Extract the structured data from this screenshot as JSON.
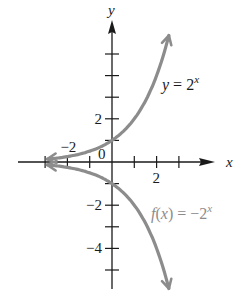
{
  "chart_data": {
    "type": "line",
    "title": "",
    "xlabel": "x",
    "ylabel": "y",
    "xlim": [
      -3,
      3
    ],
    "ylim": [
      -6,
      6
    ],
    "grid": false,
    "x_tick_labels": [
      {
        "value": -2,
        "label": "−2"
      },
      {
        "value": 2,
        "label": "2"
      }
    ],
    "y_tick_labels": [
      {
        "value": 2,
        "label": "2"
      },
      {
        "value": -2,
        "label": "−2"
      },
      {
        "value": -4,
        "label": "−4"
      }
    ],
    "origin_label": "0",
    "x_ticks": [
      -3,
      -2,
      -1,
      1,
      2,
      3
    ],
    "y_ticks": [
      -5,
      -4,
      -3,
      -2,
      -1,
      1,
      2,
      3,
      4,
      5
    ],
    "series": [
      {
        "name": "y = 2^x",
        "label_main": "y = 2",
        "label_sup": "x",
        "expression": "2^x",
        "color": "#8c8c8c",
        "x_range": [
          -2.9,
          2.55
        ],
        "x": [
          -2.9,
          -2,
          -1,
          0,
          1,
          2,
          2.55
        ],
        "values": [
          0.13,
          0.25,
          0.5,
          1,
          2,
          4,
          5.86
        ]
      },
      {
        "name": "f(x) = -2^x",
        "label_main": "f(x) = −2",
        "label_sup": "x",
        "expression": "-2^x",
        "color": "#8c8c8c",
        "x_range": [
          -2.9,
          2.55
        ],
        "x": [
          -2.9,
          -2,
          -1,
          0,
          1,
          2,
          2.55
        ],
        "values": [
          -0.13,
          -0.25,
          -0.5,
          -1,
          -2,
          -4,
          -5.86
        ]
      }
    ],
    "legend": "inline labels beside curves"
  },
  "colors": {
    "axis": "#1a1a1a",
    "curve": "#8c8c8c",
    "background": "#ffffff"
  }
}
